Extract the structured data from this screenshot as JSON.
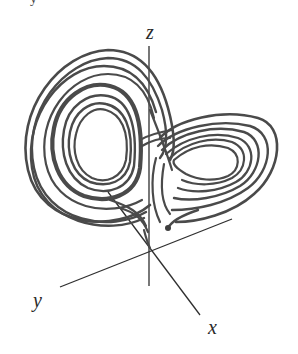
{
  "figure": {
    "type": "3d-trajectory",
    "axes": {
      "x": {
        "label": "x"
      },
      "y": {
        "label": "y"
      },
      "z": {
        "label": "z"
      }
    },
    "caption_fragment": "y",
    "colors": {
      "trajectory": "#4a4a4a",
      "axis": "#2f2f2f",
      "background": "#ffffff"
    },
    "lobes": [
      {
        "name": "left-lobe",
        "center_px": [
          92,
          140
        ]
      },
      {
        "name": "right-lobe",
        "center_px": [
          214,
          154
        ]
      }
    ],
    "endpoint_marker": {
      "label": "trajectory-start-point",
      "px": [
        168,
        228
      ]
    }
  }
}
